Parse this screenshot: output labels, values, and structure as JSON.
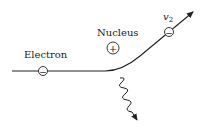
{
  "diagram": {
    "labels": {
      "electron": "Electron",
      "nucleus": "Nucleus",
      "v2": "v",
      "v2_sub": "2"
    },
    "symbols": {
      "electron_charge": "−",
      "nucleus_charge": "+",
      "outgoing_electron_charge": "−"
    },
    "colors": {
      "stroke": "#222222",
      "background": "#ffffff"
    }
  }
}
